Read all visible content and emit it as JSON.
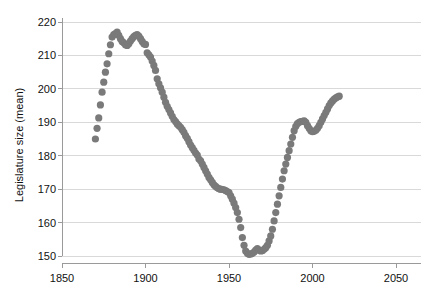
{
  "chart_data": {
    "type": "scatter",
    "title": "",
    "xlabel": "",
    "ylabel": "Legislature size (mean)",
    "xlim": [
      1850,
      2050
    ],
    "ylim": [
      150,
      220
    ],
    "xticks": [
      1850,
      1900,
      1950,
      2000,
      2050
    ],
    "xtick_labels": [
      "1850",
      "1900",
      "1950",
      "2000",
      "2050"
    ],
    "yticks": [
      150,
      160,
      170,
      180,
      190,
      200,
      210,
      220
    ],
    "ytick_labels": [
      "150",
      "160",
      "170",
      "180",
      "190",
      "200",
      "210",
      "220"
    ],
    "grid": "horizontal",
    "legend": "none",
    "marker": {
      "shape": "circle",
      "color": "#7a7a7a",
      "size": 3.6
    },
    "axis_color": "#9a9a9a",
    "grid_color": "#d9d9d9",
    "background": "#ffffff",
    "x": [
      1870,
      1871,
      1872,
      1873,
      1874,
      1875,
      1876,
      1877,
      1878,
      1879,
      1880,
      1881,
      1882,
      1883,
      1884,
      1885,
      1886,
      1887,
      1888,
      1889,
      1890,
      1891,
      1892,
      1893,
      1894,
      1895,
      1896,
      1897,
      1898,
      1899,
      1900,
      1901,
      1902,
      1903,
      1904,
      1905,
      1906,
      1907,
      1908,
      1909,
      1910,
      1911,
      1912,
      1913,
      1914,
      1915,
      1916,
      1917,
      1918,
      1919,
      1920,
      1921,
      1922,
      1923,
      1924,
      1925,
      1926,
      1927,
      1928,
      1929,
      1930,
      1931,
      1932,
      1933,
      1934,
      1935,
      1936,
      1937,
      1938,
      1939,
      1940,
      1941,
      1942,
      1943,
      1944,
      1945,
      1946,
      1947,
      1948,
      1949,
      1950,
      1951,
      1952,
      1953,
      1954,
      1955,
      1956,
      1957,
      1958,
      1959,
      1960,
      1961,
      1962,
      1963,
      1964,
      1965,
      1966,
      1967,
      1968,
      1969,
      1970,
      1971,
      1972,
      1973,
      1974,
      1975,
      1976,
      1977,
      1978,
      1979,
      1980,
      1981,
      1982,
      1983,
      1984,
      1985,
      1986,
      1987,
      1988,
      1989,
      1990,
      1991,
      1992,
      1993,
      1994,
      1995,
      1996,
      1997,
      1998,
      1999,
      2000,
      2001,
      2002,
      2003,
      2004,
      2005,
      2006,
      2007,
      2008,
      2009,
      2010,
      2011,
      2012,
      2013,
      2014,
      2015,
      2016
    ],
    "y": [
      185.0,
      188.2,
      191.3,
      195.2,
      199.0,
      202.0,
      205.0,
      207.5,
      210.5,
      213.2,
      215.5,
      216.2,
      216.5,
      217.0,
      216.0,
      215.0,
      214.2,
      213.8,
      213.2,
      213.0,
      213.5,
      214.3,
      215.0,
      215.6,
      216.0,
      216.2,
      215.8,
      215.0,
      214.2,
      213.5,
      213.3,
      210.8,
      210.2,
      209.5,
      208.3,
      207.0,
      205.5,
      203.0,
      201.5,
      200.3,
      199.0,
      197.5,
      196.0,
      194.8,
      193.8,
      192.8,
      191.8,
      190.8,
      190.2,
      189.5,
      189.0,
      188.5,
      187.8,
      187.0,
      186.0,
      185.2,
      184.2,
      183.2,
      182.4,
      181.6,
      180.8,
      180.2,
      179.0,
      178.5,
      177.5,
      176.5,
      175.5,
      174.5,
      173.5,
      172.8,
      172.0,
      171.3,
      170.8,
      170.4,
      170.1,
      170.0,
      169.9,
      169.8,
      169.6,
      169.3,
      169.0,
      168.0,
      167.0,
      165.8,
      164.5,
      163.0,
      161.0,
      158.5,
      155.5,
      153.2,
      151.5,
      150.8,
      150.5,
      150.6,
      150.8,
      151.2,
      151.8,
      152.2,
      151.8,
      151.5,
      151.6,
      152.0,
      152.5,
      153.2,
      154.5,
      156.0,
      158.0,
      160.5,
      163.0,
      165.5,
      168.0,
      170.5,
      173.0,
      175.5,
      177.5,
      179.5,
      181.5,
      183.5,
      185.5,
      187.5,
      188.8,
      189.6,
      190.0,
      190.2,
      190.3,
      190.4,
      190.0,
      189.0,
      188.2,
      187.5,
      187.2,
      187.3,
      187.6,
      188.2,
      189.0,
      190.0,
      191.0,
      192.0,
      193.0,
      194.0,
      195.0,
      195.8,
      196.4,
      196.9,
      197.3,
      197.6,
      197.8
    ]
  }
}
